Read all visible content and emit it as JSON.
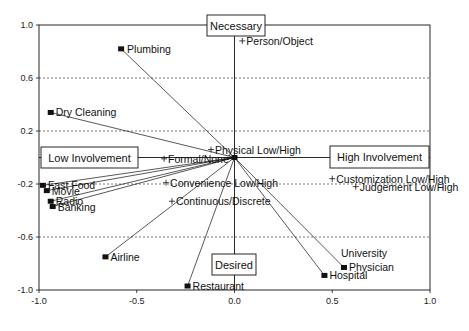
{
  "chart_data": {
    "type": "scatter",
    "title": "",
    "xlabel": "",
    "ylabel": "",
    "xlim": [
      -1.0,
      1.0
    ],
    "ylim": [
      -1.0,
      1.0
    ],
    "x_ticks": [
      "-1.0",
      "-0.5",
      "0.0",
      "0.5",
      "1.0"
    ],
    "y_ticks": [
      "1.0",
      "0.6",
      "0.2",
      "-0.2",
      "-0.6",
      "-1.0"
    ],
    "grid": {
      "horizontal_dashed": [
        0.6,
        0.2,
        -0.2,
        -0.6
      ],
      "vertical_center_line": 0.0
    },
    "legend": null,
    "axis_boxes": {
      "top": "Necessary",
      "bottom": "Desired",
      "left": "Low Involvement",
      "right": "High Involvement"
    },
    "series": [
      {
        "name": "Services",
        "marker": "square",
        "vectors_from_origin": true,
        "points": [
          {
            "label": "Plumbing",
            "x": -0.58,
            "y": 0.82
          },
          {
            "label": "Dry Cleaning",
            "x": -0.94,
            "y": 0.34
          },
          {
            "label": "Fast Food",
            "x": -0.98,
            "y": -0.21
          },
          {
            "label": "Movie",
            "x": -0.96,
            "y": -0.25
          },
          {
            "label": "Radio",
            "x": -0.94,
            "y": -0.33
          },
          {
            "label": "Banking",
            "x": -0.93,
            "y": -0.37
          },
          {
            "label": "Airline",
            "x": -0.66,
            "y": -0.75
          },
          {
            "label": "Restaurant",
            "x": -0.24,
            "y": -0.97
          },
          {
            "label": "Hospital",
            "x": 0.46,
            "y": -0.89
          },
          {
            "label": "University Physician",
            "x": 0.56,
            "y": -0.83
          }
        ]
      },
      {
        "name": "Attributes",
        "marker": "plus",
        "vectors_from_origin": false,
        "points": [
          {
            "label": "Person/Object",
            "x": 0.04,
            "y": 0.88
          },
          {
            "label": "Physical Low/High",
            "x": -0.12,
            "y": 0.06
          },
          {
            "label": "Formal/None",
            "x": -0.36,
            "y": -0.01
          },
          {
            "label": "Convenience Low/High",
            "x": -0.35,
            "y": -0.19
          },
          {
            "label": "Continuous/Discrete",
            "x": -0.32,
            "y": -0.33
          },
          {
            "label": "Customization Low/High",
            "x": 0.5,
            "y": -0.16
          },
          {
            "label": "Judgement Low/High",
            "x": 0.62,
            "y": -0.22
          }
        ]
      }
    ],
    "origin_marker": {
      "x": 0.0,
      "y": 0.0,
      "marker": "square"
    }
  },
  "colors": {
    "ink": "#111111",
    "grid": "#555555",
    "background": "#ffffff"
  }
}
